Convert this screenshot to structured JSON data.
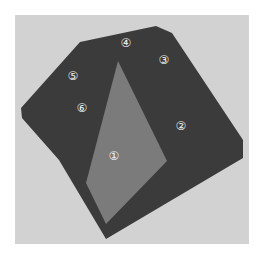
{
  "caption_fragment": "",
  "figure": {
    "background_color": "#d2d2d2",
    "dark_face_color": "#3b3b3b",
    "light_face_color": "#7b7b7b",
    "outline": "21,108 80,42 156,26 172,33 243,140 243,158 106,239 59,160 22,118",
    "highlighted_face": "118,61 167,161 106,224 86,183",
    "labels": [
      {
        "text": "①",
        "x": 114,
        "y": 156
      },
      {
        "text": "②",
        "x": 181,
        "y": 126
      },
      {
        "text": "③",
        "x": 164,
        "y": 60
      },
      {
        "text": "④",
        "x": 126,
        "y": 43
      },
      {
        "text": "⑤",
        "x": 73,
        "y": 76
      },
      {
        "text": "⑥",
        "x": 82,
        "y": 108
      }
    ]
  }
}
